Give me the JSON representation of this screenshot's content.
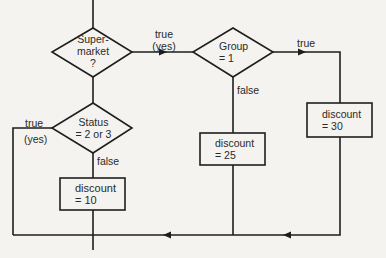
{
  "diagram": {
    "type": "flowchart",
    "decisions": [
      {
        "id": "supermarket",
        "lines": [
          "Super-",
          "market",
          "?"
        ]
      },
      {
        "id": "group",
        "lines": [
          "Group",
          "= 1"
        ]
      },
      {
        "id": "status",
        "lines": [
          "Status",
          "= 2 or 3"
        ]
      }
    ],
    "processes": [
      {
        "id": "discount30",
        "lines": [
          "discount",
          "= 30"
        ]
      },
      {
        "id": "discount25",
        "lines": [
          "discount",
          "= 25"
        ]
      },
      {
        "id": "discount10",
        "lines": [
          "discount",
          "= 10"
        ]
      }
    ],
    "edge_labels": {
      "supermarket_true": [
        "true",
        "(yes)"
      ],
      "group_true": "true",
      "group_false": "false",
      "status_true": [
        "true",
        "(yes)"
      ],
      "status_false": "false"
    },
    "colors": {
      "line": "#1e1e1e",
      "background": "#f4f3ef",
      "text": "#2a2a2a"
    }
  }
}
